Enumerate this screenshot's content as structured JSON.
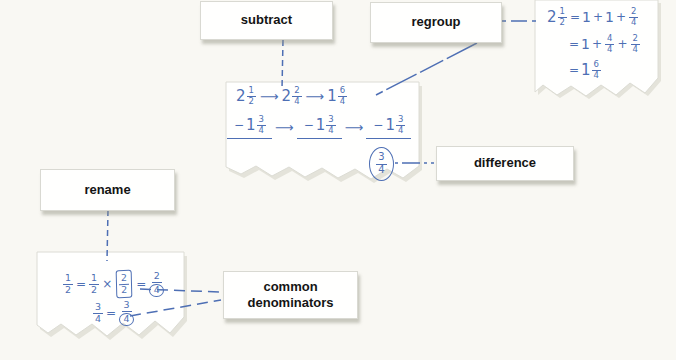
{
  "labels": {
    "subtract": "subtract",
    "regroup": "regroup",
    "difference": "difference",
    "rename": "rename",
    "common_line1": "common",
    "common_line2": "denominators"
  },
  "colors": {
    "ink": "#4e6fb4",
    "background": "#f9f8f3",
    "paper": "#fffffe",
    "paper_edge": "#dcdcd4",
    "paper_shadow": "#e4e3da",
    "label_text": "#141414"
  },
  "math": {
    "arrow": "⟶",
    "minus": "−",
    "plus": "+",
    "equals": "=",
    "times": "×",
    "main_paper": {
      "row1": [
        {
          "whole": "2",
          "num": "1",
          "den": "2"
        },
        {
          "whole": "2",
          "num": "2",
          "den": "4"
        },
        {
          "whole": "1",
          "num": "6",
          "den": "4"
        }
      ],
      "row2": [
        {
          "whole": "1",
          "num": "3",
          "den": "4"
        },
        {
          "whole": "1",
          "num": "3",
          "den": "4"
        },
        {
          "whole": "1",
          "num": "3",
          "den": "4"
        }
      ],
      "difference": {
        "num": "3",
        "den": "4"
      }
    },
    "regroup_paper": {
      "lhs": {
        "whole": "2",
        "num": "1",
        "den": "2"
      },
      "line1": {
        "term1": "1",
        "term2": "1",
        "frac_num": "2",
        "frac_den": "4"
      },
      "line2": {
        "term1": "1",
        "frac1_num": "4",
        "frac1_den": "4",
        "frac2_num": "2",
        "frac2_den": "4"
      },
      "line3": {
        "whole": "1",
        "num": "6",
        "den": "4"
      }
    },
    "rename_paper": {
      "line1": {
        "f1_num": "1",
        "f1_den": "2",
        "f2_num": "1",
        "f2_den": "2",
        "f3_num": "2",
        "f3_den": "2",
        "res_num": "2",
        "res_den": "4"
      },
      "line2": {
        "f1_num": "3",
        "f1_den": "4",
        "res_num": "3",
        "res_den": "4"
      }
    }
  }
}
